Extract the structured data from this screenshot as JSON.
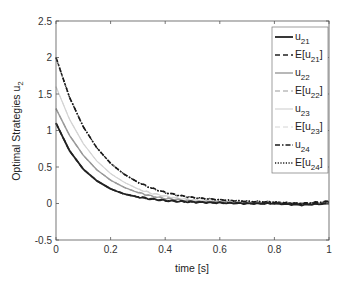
{
  "chart_data": {
    "type": "line",
    "title": "",
    "xlabel": "time [s]",
    "ylabel": "Optimal Strategies u_2",
    "xlim": [
      0,
      1
    ],
    "ylim": [
      -0.5,
      2.5
    ],
    "xticks": [
      "0",
      "0.2",
      "0.4",
      "0.6",
      "0.8",
      "1"
    ],
    "yticks": [
      "-0.5",
      "0",
      "0.5",
      "1",
      "1.5",
      "2",
      "2.5"
    ],
    "grid": false,
    "legend_position": "northeast-inside",
    "x": [
      0,
      0.05,
      0.1,
      0.15,
      0.2,
      0.25,
      0.3,
      0.35,
      0.4,
      0.45,
      0.5,
      0.6,
      0.7,
      0.8,
      0.9,
      1.0
    ],
    "series": [
      {
        "name": "u21",
        "label": "u",
        "sub": "21",
        "style": "solid",
        "color": "#222222",
        "width": 1.8,
        "values": [
          1.1,
          0.72,
          0.47,
          0.31,
          0.2,
          0.13,
          0.09,
          0.06,
          0.04,
          0.03,
          0.02,
          0.01,
          0.0,
          0.0,
          -0.02,
          0.0
        ]
      },
      {
        "name": "E[u21]",
        "label": "E[u",
        "sub": "21",
        "suffix": "]",
        "style": "dashed",
        "color": "#222222",
        "width": 1.6,
        "values": [
          1.1,
          0.72,
          0.47,
          0.31,
          0.2,
          0.13,
          0.09,
          0.06,
          0.04,
          0.03,
          0.02,
          0.01,
          0.0,
          0.0,
          -0.01,
          0.0
        ]
      },
      {
        "name": "u22",
        "label": "u",
        "sub": "22",
        "style": "solid",
        "color": "#9a9a9a",
        "width": 1.4,
        "values": [
          1.3,
          0.93,
          0.66,
          0.46,
          0.32,
          0.22,
          0.15,
          0.1,
          0.07,
          0.05,
          0.03,
          0.02,
          0.01,
          0.0,
          0.0,
          0.0
        ]
      },
      {
        "name": "E[u22]",
        "label": "E[u",
        "sub": "22",
        "suffix": "]",
        "style": "dashed",
        "color": "#9a9a9a",
        "width": 1.2,
        "values": [
          1.3,
          0.93,
          0.66,
          0.46,
          0.32,
          0.22,
          0.15,
          0.1,
          0.07,
          0.05,
          0.03,
          0.02,
          0.01,
          0.0,
          0.0,
          0.0
        ]
      },
      {
        "name": "u23",
        "label": "u",
        "sub": "23",
        "style": "solid",
        "color": "#d4d4d4",
        "width": 1.2,
        "values": [
          1.6,
          1.15,
          0.82,
          0.58,
          0.41,
          0.29,
          0.2,
          0.14,
          0.1,
          0.07,
          0.05,
          0.03,
          0.02,
          0.01,
          0.0,
          0.0
        ]
      },
      {
        "name": "E[u23]",
        "label": "E[u",
        "sub": "23",
        "suffix": "]",
        "style": "dashed",
        "color": "#d4d4d4",
        "width": 1.0,
        "values": [
          1.6,
          1.15,
          0.82,
          0.58,
          0.41,
          0.29,
          0.2,
          0.14,
          0.1,
          0.07,
          0.05,
          0.03,
          0.02,
          0.01,
          0.0,
          0.0
        ]
      },
      {
        "name": "u24",
        "label": "u",
        "sub": "24",
        "style": "dashdot",
        "color": "#1a1a1a",
        "width": 1.6,
        "values": [
          2.0,
          1.45,
          1.05,
          0.76,
          0.55,
          0.4,
          0.29,
          0.21,
          0.15,
          0.11,
          0.08,
          0.05,
          0.03,
          0.02,
          0.0,
          0.03
        ]
      },
      {
        "name": "E[u24]",
        "label": "E[u",
        "sub": "24",
        "suffix": "]",
        "style": "dotted",
        "color": "#1a1a1a",
        "width": 1.4,
        "values": [
          2.0,
          1.45,
          1.05,
          0.76,
          0.55,
          0.4,
          0.29,
          0.21,
          0.15,
          0.11,
          0.08,
          0.05,
          0.03,
          0.02,
          0.0,
          0.02
        ]
      }
    ]
  }
}
